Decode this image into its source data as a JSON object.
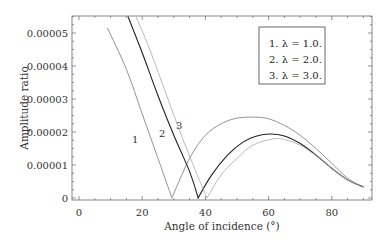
{
  "chart_data": {
    "type": "line",
    "title": "",
    "xlabel": "Angle of incidence (°)",
    "ylabel": "Amplitude ratio",
    "xlim": [
      0,
      90
    ],
    "ylim": [
      0,
      5.5e-05
    ],
    "x_ticks": [
      "0",
      "20",
      "40",
      "60",
      "80"
    ],
    "y_ticks": [
      "0",
      "0.00001",
      "0.00002",
      "0.00003",
      "0.00004",
      "0.00005"
    ],
    "grid": false,
    "legend": {
      "position": "upper right",
      "entries": [
        "1. λ = 1.0.",
        "2. λ = 2.0.",
        "3. λ = 3.0."
      ]
    },
    "curve_labels": [
      "1",
      "2",
      "3"
    ],
    "series": [
      {
        "name": "1. λ = 1.0.",
        "color": "#777777",
        "x": [
          9,
          15,
          20,
          25,
          29.4,
          35,
          40,
          45,
          50,
          55.7,
          60,
          65,
          70,
          75,
          80,
          85,
          90
        ],
        "y": [
          5.15e-05,
          3.9e-05,
          2.55e-05,
          1.2e-05,
          0,
          1.2e-05,
          1.9e-05,
          2.25e-05,
          2.42e-05,
          2.45e-05,
          2.4e-05,
          2.2e-05,
          1.9e-05,
          1.5e-05,
          1.05e-05,
          6e-06,
          3.3e-06
        ]
      },
      {
        "name": "2. λ = 2.0.",
        "color": "#222222",
        "x": [
          15.5,
          20,
          25,
          30,
          35,
          37.7,
          42,
          47,
          52,
          56,
          60.4,
          65,
          70,
          75,
          80,
          85,
          90
        ],
        "y": [
          5.5e-05,
          4.4e-05,
          3.1e-05,
          1.9e-05,
          8e-06,
          0,
          7e-06,
          1.3e-05,
          1.7e-05,
          1.87e-05,
          1.94e-05,
          1.88e-05,
          1.65e-05,
          1.3e-05,
          9e-06,
          5.5e-06,
          3.3e-06
        ]
      },
      {
        "name": "3. λ = 3.0.",
        "color": "#aaaaaa",
        "x": [
          18,
          22,
          27,
          32,
          37,
          40.5,
          45,
          50,
          55,
          61.4,
          65,
          70,
          75,
          80,
          85,
          90
        ],
        "y": [
          5.5e-05,
          4.6e-05,
          3.3e-05,
          2e-05,
          8e-06,
          0,
          7e-06,
          1.2e-05,
          1.6e-05,
          1.79e-05,
          1.77e-05,
          1.6e-05,
          1.28e-05,
          9e-06,
          5.5e-06,
          3.3e-06
        ]
      }
    ]
  }
}
